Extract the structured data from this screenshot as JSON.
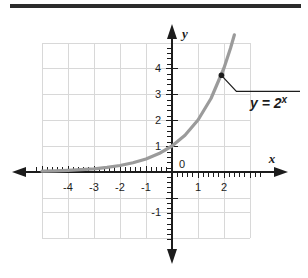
{
  "figure": {
    "name": "exponential-function-graph",
    "has_top_rule": true
  },
  "chart_data": {
    "type": "line",
    "title": "",
    "subtitle": "",
    "xlabel": "x",
    "ylabel": "y",
    "xlim": [
      -5.25,
      3.0
    ],
    "ylim": [
      -1.6,
      5.2
    ],
    "grid": true,
    "grid_step": 1,
    "legend": "none",
    "annotations": [
      {
        "text": "y = 2",
        "exponent": "x",
        "points_to_x": 1.9,
        "points_to_y": 3.72,
        "marker": "dot"
      }
    ],
    "axes": {
      "x_ticks": [
        -4,
        -3,
        -2,
        -1,
        1,
        2
      ],
      "x_tick_labels": [
        "-4",
        "-3",
        "-2",
        "-1",
        "1",
        "2"
      ],
      "y_ticks": [
        -1,
        1,
        2,
        3,
        4
      ],
      "y_tick_labels": [
        "-1",
        "1",
        "2",
        "3",
        "4"
      ],
      "origin_label": "0",
      "minor_tick_spacing": 0.2,
      "x_axis_arrows": [
        "left",
        "right"
      ],
      "y_axis_arrows": [
        "up",
        "down"
      ]
    },
    "series": [
      {
        "name": "y = 2^x",
        "formula": "y = 2^x",
        "color": "#9b9b9b",
        "linewidth": 3,
        "x": [
          -5.0,
          -4.5,
          -4.0,
          -3.5,
          -3.0,
          -2.5,
          -2.0,
          -1.5,
          -1.0,
          -0.5,
          0.0,
          0.5,
          1.0,
          1.5,
          2.0,
          2.25,
          2.4
        ],
        "values": [
          0.031,
          0.044,
          0.063,
          0.088,
          0.125,
          0.177,
          0.25,
          0.354,
          0.5,
          0.707,
          1.0,
          1.414,
          2.0,
          2.828,
          4.0,
          4.757,
          5.278
        ]
      }
    ]
  },
  "colors": {
    "curve": "#9b9b9b",
    "grid": "#d6d6d6",
    "axis": "#1c1c1c",
    "rule": "#2b2b2b",
    "text": "#1c1c1c"
  }
}
